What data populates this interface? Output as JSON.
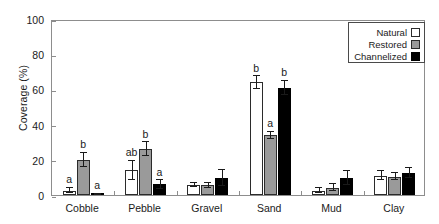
{
  "chart_data": {
    "type": "bar",
    "title": "",
    "xlabel": "",
    "ylabel": "Coverage (%)",
    "ylim": [
      0,
      100
    ],
    "yticks": [
      0,
      20,
      40,
      60,
      80,
      100
    ],
    "grid": false,
    "legend_position": "top-right",
    "categories": [
      "Cobble",
      "Pebble",
      "Gravel",
      "Sand",
      "Mud",
      "Clay"
    ],
    "series": [
      {
        "name": "Natural",
        "color": "#ffffff",
        "values": [
          2.5,
          14,
          5.5,
          64,
          2.5,
          11
        ],
        "errors": [
          1.5,
          5.5,
          1.2,
          3.5,
          1.5,
          2.5
        ],
        "letters": [
          "a",
          "ab",
          "",
          "b",
          "",
          ""
        ]
      },
      {
        "name": "Restored",
        "color": "#9a9a9a",
        "values": [
          20,
          26,
          5.5,
          34,
          4,
          10.5
        ],
        "errors": [
          4,
          4,
          1.5,
          2,
          2,
          2
        ],
        "letters": [
          "b",
          "b",
          "",
          "a",
          "",
          ""
        ]
      },
      {
        "name": "Channelized",
        "color": "#000000",
        "values": [
          0.4,
          6,
          9.5,
          61,
          9.5,
          12.5
        ],
        "errors": [
          0.3,
          2.5,
          4.5,
          4,
          4,
          3
        ],
        "letters": [
          "a",
          "a",
          "",
          "b",
          "",
          ""
        ]
      }
    ]
  },
  "legend": {
    "items": [
      {
        "label": "Natural"
      },
      {
        "label": "Restored"
      },
      {
        "label": "Channelized"
      }
    ]
  }
}
